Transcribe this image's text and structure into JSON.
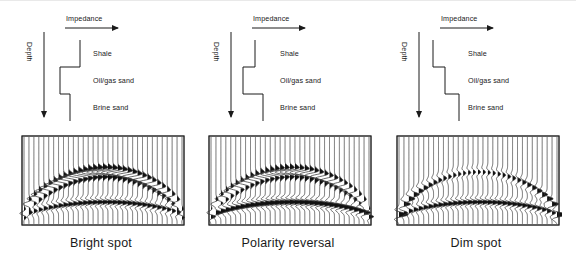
{
  "figure": {
    "panels": [
      {
        "id": "bright-spot",
        "caption": "Bright spot",
        "impedance_label": "Impedance",
        "depth_label": "Depth",
        "layers": [
          {
            "name": "Shale",
            "label": "Shale"
          },
          {
            "name": "Oil/gas sand",
            "label": "Oil/gas sand"
          },
          {
            "name": "Brine sand",
            "label": "Brine sand"
          }
        ],
        "impedance_profile": {
          "description": "Shale high impedance; oil/gas sand steps left (large decrease); brine sand steps right (partial increase)",
          "steps": [
            {
              "layer": "Shale",
              "impedance_x": 72,
              "y_top": 36,
              "y_bottom": 63
            },
            {
              "layer": "Oil/gas sand",
              "impedance_x": 52,
              "y_top": 63,
              "y_bottom": 90
            },
            {
              "layer": "Brine sand",
              "impedance_x": 62,
              "y_top": 90,
              "y_bottom": 117
            }
          ]
        },
        "seismic": {
          "type": "variable-area-wiggle",
          "n_traces": 33,
          "top_event": {
            "polarity": "negative",
            "strength": "strong",
            "shape": "arch"
          },
          "base_event": {
            "polarity": "positive",
            "strength": "moderate",
            "shape": "arch"
          },
          "anomaly": "Strong bright reflection over the reservoir arch"
        }
      },
      {
        "id": "polarity-reversal",
        "caption": "Polarity reversal",
        "impedance_label": "Impedance",
        "depth_label": "Depth",
        "layers": [
          {
            "name": "Shale",
            "label": "Shale"
          },
          {
            "name": "Oil/gas sand",
            "label": "Oil/gas sand"
          },
          {
            "name": "Brine sand",
            "label": "Brine sand"
          }
        ],
        "impedance_profile": {
          "description": "Shale moderate; oil/gas sand steps left; brine sand steps right past the shale value",
          "steps": [
            {
              "layer": "Shale",
              "impedance_x": 60,
              "y_top": 36,
              "y_bottom": 63
            },
            {
              "layer": "Oil/gas sand",
              "impedance_x": 48,
              "y_top": 63,
              "y_bottom": 90
            },
            {
              "layer": "Brine sand",
              "impedance_x": 68,
              "y_top": 90,
              "y_bottom": 117
            }
          ]
        },
        "seismic": {
          "type": "variable-area-wiggle",
          "n_traces": 33,
          "top_event": {
            "polarity": "negative",
            "strength": "strong",
            "shape": "arch"
          },
          "base_event": {
            "polarity": "positive",
            "strength": "strong",
            "shape": "flat"
          },
          "anomaly": "Reflection changes sign across the fluid contact"
        }
      },
      {
        "id": "dim-spot",
        "caption": "Dim spot",
        "impedance_label": "Impedance",
        "depth_label": "Depth",
        "layers": [
          {
            "name": "Shale",
            "label": "Shale"
          },
          {
            "name": "Oil/gas sand",
            "label": "Oil/gas sand"
          },
          {
            "name": "Brine sand",
            "label": "Brine sand"
          }
        ],
        "impedance_profile": {
          "description": "Impedance increases downward at each boundary; oil/gas sand still higher than shale",
          "steps": [
            {
              "layer": "Shale",
              "impedance_x": 50,
              "y_top": 36,
              "y_bottom": 63
            },
            {
              "layer": "Oil/gas sand",
              "impedance_x": 62,
              "y_top": 63,
              "y_bottom": 90
            },
            {
              "layer": "Brine sand",
              "impedance_x": 76,
              "y_top": 90,
              "y_bottom": 117
            }
          ]
        },
        "seismic": {
          "type": "variable-area-wiggle",
          "n_traces": 33,
          "top_event": {
            "polarity": "positive",
            "strength": "weak",
            "shape": "arch"
          },
          "base_event": {
            "polarity": "positive",
            "strength": "moderate",
            "shape": "arch"
          },
          "anomaly": "Reflection weakens (dims) over the reservoir"
        }
      }
    ],
    "colors": {
      "ink": "#1a1a1a",
      "frame": "#2b2b2b",
      "trace": "#3a3a3a",
      "fill": "#111111"
    }
  }
}
